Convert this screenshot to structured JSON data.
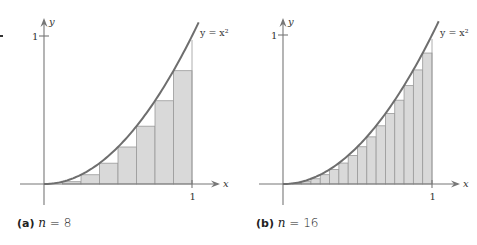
{
  "chart_data": [
    {
      "type": "area",
      "panel": "a",
      "title": "(a) n = 8",
      "function": "y = x^2",
      "curve_label": "y = x²",
      "xlabel": "x",
      "ylabel": "y",
      "xlim": [
        0,
        1
      ],
      "ylim": [
        0,
        1
      ],
      "x_ticks": [
        "1"
      ],
      "y_ticks": [
        "1"
      ],
      "n": 8,
      "rectangle_rule": "left endpoint (lower sum)",
      "rectangles": [
        {
          "x0": 0.0,
          "x1": 0.125,
          "height": 0.0
        },
        {
          "x0": 0.125,
          "x1": 0.25,
          "height": 0.015625
        },
        {
          "x0": 0.25,
          "x1": 0.375,
          "height": 0.0625
        },
        {
          "x0": 0.375,
          "x1": 0.5,
          "height": 0.140625
        },
        {
          "x0": 0.5,
          "x1": 0.625,
          "height": 0.25
        },
        {
          "x0": 0.625,
          "x1": 0.75,
          "height": 0.390625
        },
        {
          "x0": 0.75,
          "x1": 0.875,
          "height": 0.5625
        },
        {
          "x0": 0.875,
          "x1": 1.0,
          "height": 0.765625
        }
      ],
      "grid": false
    },
    {
      "type": "area",
      "panel": "b",
      "title": "(b) n = 16",
      "function": "y = x^2",
      "curve_label": "y = x²",
      "xlabel": "x",
      "ylabel": "y",
      "xlim": [
        0,
        1
      ],
      "ylim": [
        0,
        1
      ],
      "x_ticks": [
        "1"
      ],
      "y_ticks": [
        "1"
      ],
      "n": 16,
      "rectangle_rule": "left endpoint (lower sum)",
      "rectangles": [
        {
          "x0": 0.0,
          "x1": 0.0625,
          "height": 0.0
        },
        {
          "x0": 0.0625,
          "x1": 0.125,
          "height": 0.0039
        },
        {
          "x0": 0.125,
          "x1": 0.1875,
          "height": 0.0156
        },
        {
          "x0": 0.1875,
          "x1": 0.25,
          "height": 0.0352
        },
        {
          "x0": 0.25,
          "x1": 0.3125,
          "height": 0.0625
        },
        {
          "x0": 0.3125,
          "x1": 0.375,
          "height": 0.0977
        },
        {
          "x0": 0.375,
          "x1": 0.4375,
          "height": 0.1406
        },
        {
          "x0": 0.4375,
          "x1": 0.5,
          "height": 0.1914
        },
        {
          "x0": 0.5,
          "x1": 0.5625,
          "height": 0.25
        },
        {
          "x0": 0.5625,
          "x1": 0.625,
          "height": 0.3164
        },
        {
          "x0": 0.625,
          "x1": 0.6875,
          "height": 0.3906
        },
        {
          "x0": 0.6875,
          "x1": 0.75,
          "height": 0.4727
        },
        {
          "x0": 0.75,
          "x1": 0.8125,
          "height": 0.5625
        },
        {
          "x0": 0.8125,
          "x1": 0.875,
          "height": 0.6602
        },
        {
          "x0": 0.875,
          "x1": 0.9375,
          "height": 0.7656
        },
        {
          "x0": 0.9375,
          "x1": 1.0,
          "height": 0.8789
        }
      ],
      "grid": false
    }
  ],
  "captions": {
    "a": {
      "tag": "(a)",
      "var": "n",
      "rest": " = 8"
    },
    "b": {
      "tag": "(b)",
      "var": "n",
      "rest": " = 16"
    }
  },
  "colors": {
    "rect_fill": "#d9d9d9",
    "rect_stroke": "#9a9a9a",
    "curve": "#6e6e6e",
    "axis": "#777777",
    "text": "#333333"
  }
}
